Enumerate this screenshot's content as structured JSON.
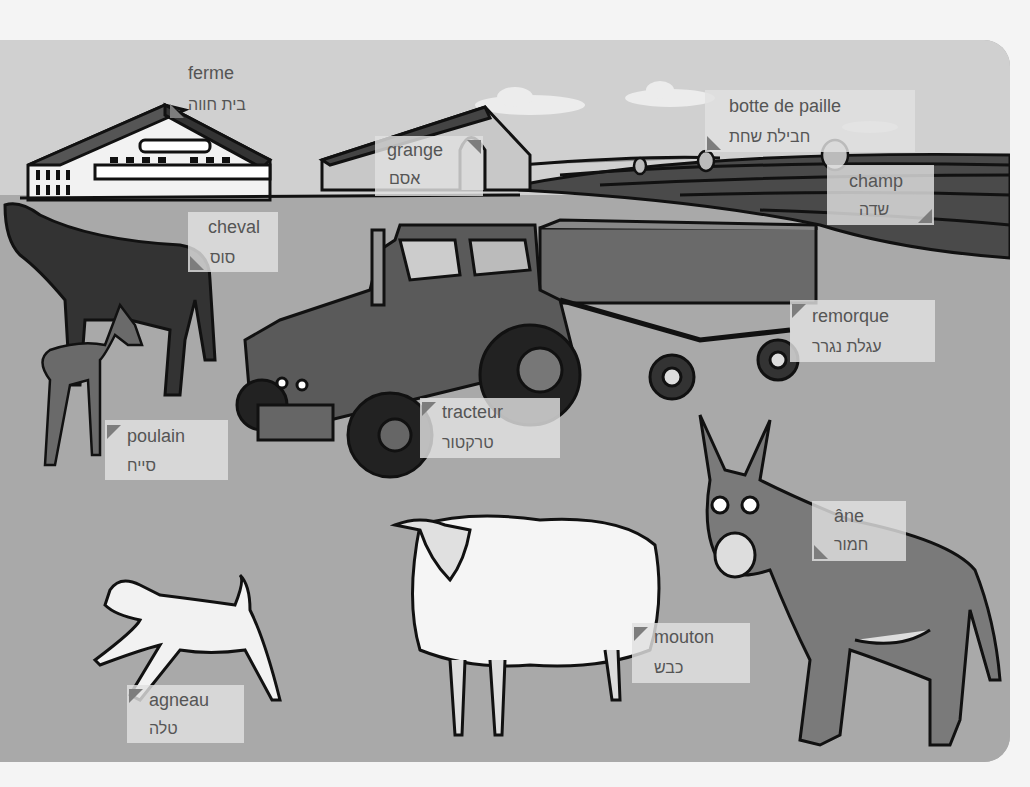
{
  "scene": {
    "title": "Farm picture dictionary",
    "colors": {
      "page_bg": "#f4f4f4",
      "sky": "#d0d0d0",
      "ground": "#a9a9a9",
      "field_dark": "#4a4a4a",
      "label_bg": "#e1e1e1",
      "label_text": "#555555",
      "pointer": "#7d7d7d"
    }
  },
  "labels": [
    {
      "id": "ferme",
      "fr": "ferme",
      "he": "בית חווה"
    },
    {
      "id": "grange",
      "fr": "grange",
      "he": "אסם"
    },
    {
      "id": "botte",
      "fr": "botte de paille",
      "he": "חבילת שחת"
    },
    {
      "id": "champ",
      "fr": "champ",
      "he": "שדה"
    },
    {
      "id": "cheval",
      "fr": "cheval",
      "he": "סוס"
    },
    {
      "id": "remorque",
      "fr": "remorque",
      "he": "עגלת נגרר"
    },
    {
      "id": "tracteur",
      "fr": "tracteur",
      "he": "טרקטור"
    },
    {
      "id": "poulain",
      "fr": "poulain",
      "he": "סייח"
    },
    {
      "id": "ane",
      "fr": "âne",
      "he": "חמור"
    },
    {
      "id": "mouton",
      "fr": "mouton",
      "he": "כבש"
    },
    {
      "id": "agneau",
      "fr": "agneau",
      "he": "טלה"
    }
  ]
}
